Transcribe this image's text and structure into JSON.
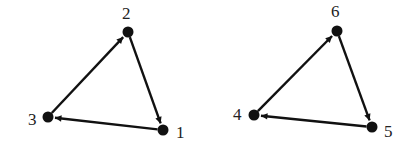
{
  "diagram": {
    "type": "directed-graph",
    "colors": {
      "stroke": "#111111",
      "node": "#111111",
      "label": "#222222",
      "background": "#ffffff"
    },
    "components": [
      {
        "id": "left-triangle",
        "nodes": [
          {
            "id": "1",
            "label": "1",
            "x": 163,
            "y": 130,
            "lx": 176,
            "ly": 138
          },
          {
            "id": "2",
            "label": "2",
            "x": 128,
            "y": 32,
            "lx": 122,
            "ly": 19
          },
          {
            "id": "3",
            "label": "3",
            "x": 48,
            "y": 117,
            "lx": 28,
            "ly": 125
          }
        ],
        "edges": [
          {
            "from": "3",
            "to": "2"
          },
          {
            "from": "2",
            "to": "1"
          },
          {
            "from": "1",
            "to": "3"
          }
        ]
      },
      {
        "id": "right-triangle",
        "nodes": [
          {
            "id": "4",
            "label": "4",
            "x": 254,
            "y": 115,
            "lx": 233,
            "ly": 120
          },
          {
            "id": "5",
            "label": "5",
            "x": 372,
            "y": 127,
            "lx": 384,
            "ly": 137
          },
          {
            "id": "6",
            "label": "6",
            "x": 337,
            "y": 31,
            "lx": 331,
            "ly": 17
          }
        ],
        "edges": [
          {
            "from": "4",
            "to": "6"
          },
          {
            "from": "6",
            "to": "5"
          },
          {
            "from": "5",
            "to": "4"
          }
        ]
      }
    ]
  }
}
